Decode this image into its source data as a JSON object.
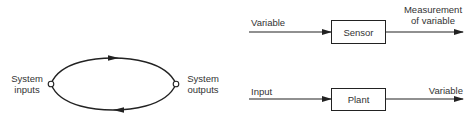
{
  "left_diagram": {
    "type": "closed-loop",
    "input_label_line1": "System",
    "input_label_line2": "inputs",
    "output_label_line1": "System",
    "output_label_line2": "outputs",
    "top_arrow_direction": "right",
    "bottom_arrow_direction": "left"
  },
  "sensor_diagram": {
    "input_label": "Variable",
    "block_label": "Sensor",
    "output_label_line1": "Measurement",
    "output_label_line2": "of variable"
  },
  "plant_diagram": {
    "input_label": "Input",
    "block_label": "Plant",
    "output_label": "Variable"
  },
  "colors": {
    "line": "#222222",
    "text": "#333333",
    "background": "#ffffff"
  }
}
